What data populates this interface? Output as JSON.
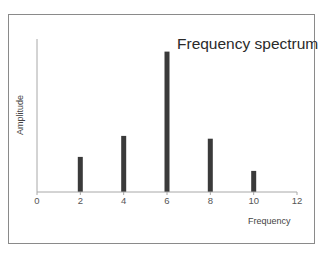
{
  "chart_data": {
    "type": "bar",
    "title": "Frequency spectrum",
    "xlabel": "Frequency",
    "ylabel": "Amplitude",
    "x": [
      2,
      4,
      6,
      8,
      10
    ],
    "values": [
      0.25,
      0.4,
      1.0,
      0.38,
      0.15
    ],
    "xlim": [
      0,
      12
    ],
    "ylim": [
      0,
      1.09
    ],
    "xticks": [
      0,
      2,
      4,
      6,
      8,
      10,
      12
    ],
    "yticks": [],
    "grid": false,
    "legend": null,
    "bar_color": "#3a3a3a",
    "axis_color": "#a0a0a0"
  },
  "labels": {
    "title": "Frequency spectrum",
    "xlabel": "Frequency",
    "ylabel": "Amplitude",
    "xticks": [
      "0",
      "2",
      "4",
      "6",
      "8",
      "10",
      "12"
    ]
  }
}
